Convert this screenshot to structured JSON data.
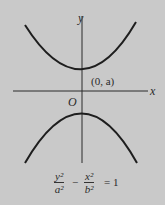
{
  "diagram": {
    "axis_labels": {
      "x": "x",
      "y": "y"
    },
    "origin_label": "O",
    "vertex_label": "(0, a)",
    "equation": {
      "term1_num": "y²",
      "term1_den": "a²",
      "minus": "−",
      "term2_num": "x²",
      "term2_den": "b²",
      "equals": "= 1"
    },
    "colors": {
      "background": "#c9c9c9",
      "stroke": "#1e1e1e"
    }
  }
}
